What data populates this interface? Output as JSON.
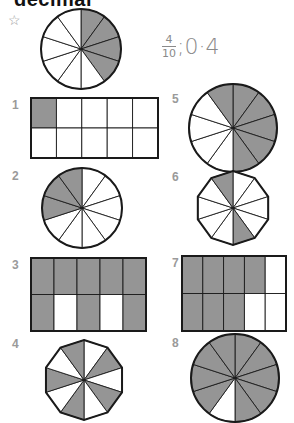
{
  "heading": "decimal",
  "example": {
    "marker": "☆",
    "numerator": "4",
    "denominator": "10",
    "separator": ";",
    "decimal": "0·4"
  },
  "colors": {
    "shade": "#959595",
    "outline": "#1a1a1a",
    "label": "#9a9a9a"
  },
  "questions": [
    {
      "number": "1",
      "shape": "rectangle 2x5",
      "shaded": 1,
      "total": 10
    },
    {
      "number": "2",
      "shape": "circle",
      "shaded": 3,
      "total": 10
    },
    {
      "number": "3",
      "shape": "rectangle 2x5",
      "shaded": 8,
      "total": 10
    },
    {
      "number": "4",
      "shape": "decagon",
      "shaded": 5,
      "total": 10
    },
    {
      "number": "5",
      "shape": "circle",
      "shaded": 6,
      "total": 10
    },
    {
      "number": "6",
      "shape": "decagon",
      "shaded": 2,
      "total": 10
    },
    {
      "number": "7",
      "shape": "rectangle 2x5",
      "shaded": 7,
      "total": 10
    },
    {
      "number": "8",
      "shape": "circle",
      "shaded": 9,
      "total": 10
    }
  ]
}
